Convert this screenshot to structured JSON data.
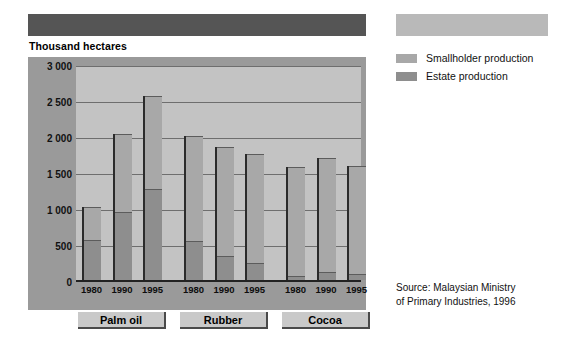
{
  "header": {
    "title_bar_left_color": "#555555",
    "title_bar_right_color": "#b9b9b9"
  },
  "axis_unit_label": "Thousand hectares",
  "legend": {
    "items": [
      {
        "label": "Smallholder production",
        "color": "#a8a8a8"
      },
      {
        "label": "Estate production",
        "color": "#8e8e8e"
      }
    ]
  },
  "source": {
    "line1": "Source: Malaysian Ministry",
    "line2": "of Primary Industries, 1996"
  },
  "categories": [
    {
      "label": "Palm oil"
    },
    {
      "label": "Rubber"
    },
    {
      "label": "Cocoa"
    }
  ],
  "chart_data": {
    "type": "bar",
    "stacked": true,
    "title": "",
    "subtitle": "",
    "xlabel": "",
    "ylabel": "Thousand hectares",
    "ylim": [
      0,
      3000
    ],
    "ytick_labels": [
      "3 000",
      "2 500",
      "2 000",
      "1 500",
      "1 000",
      "500",
      "0"
    ],
    "yticks": [
      3000,
      2500,
      2000,
      1500,
      1000,
      500,
      0
    ],
    "grid": true,
    "legend_position": "right",
    "groups": [
      "Palm oil",
      "Rubber",
      "Cocoa"
    ],
    "x": [
      "1980",
      "1990",
      "1995",
      "1980",
      "1990",
      "1995",
      "1980",
      "1990",
      "1995"
    ],
    "categories": [
      "1980",
      "1990",
      "1995"
    ],
    "series": [
      {
        "name": "Estate production",
        "color": "#8e8e8e",
        "values_by_group": {
          "Palm oil": [
            560,
            940,
            1270
          ],
          "Rubber": [
            540,
            340,
            230
          ],
          "Cocoa": [
            60,
            110,
            80
          ]
        }
      },
      {
        "name": "Smallholder production",
        "color": "#a8a8a8",
        "values_by_group": {
          "Palm oil": [
            460,
            1090,
            1280
          ],
          "Rubber": [
            1460,
            1510,
            1520
          ],
          "Cocoa": [
            1510,
            1590,
            1510
          ]
        }
      }
    ],
    "totals_by_group": {
      "Palm oil": [
        1020,
        2030,
        2550
      ],
      "Rubber": [
        2000,
        1850,
        1750
      ],
      "Cocoa": [
        1570,
        1700,
        1590
      ]
    },
    "annotations": [
      "Source: Malaysian Ministry of Primary Industries, 1996"
    ]
  }
}
